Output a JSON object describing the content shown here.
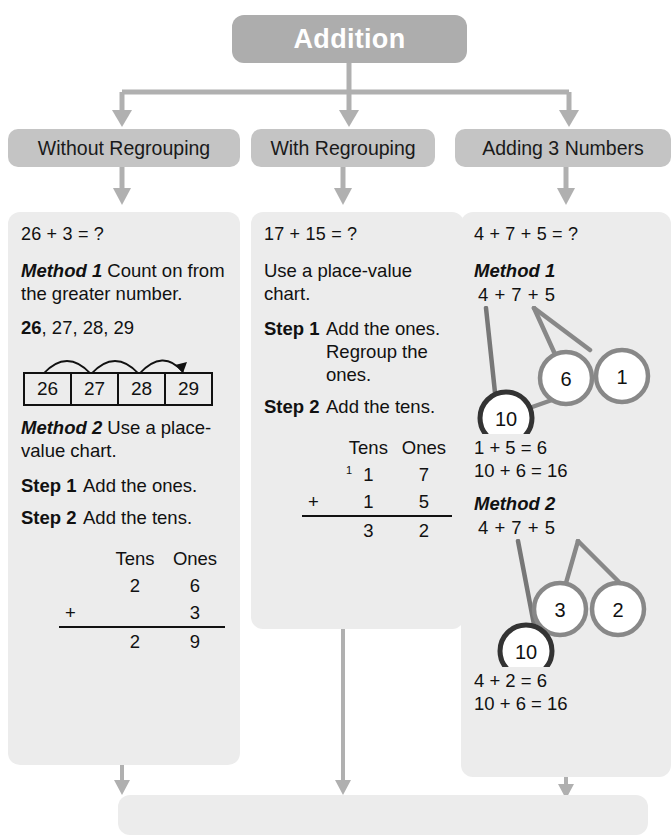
{
  "title": {
    "label": "Addition"
  },
  "colors": {
    "title_box": "#adadad",
    "category_box": "#c4c4c4",
    "panel": "#ececec",
    "connector": "#b0b0b0",
    "bond_circle": "#888888",
    "bond_total_circle": "#333333",
    "text": "#111111"
  },
  "categories": [
    {
      "label": "Without Regrouping"
    },
    {
      "label": "With Regrouping"
    },
    {
      "label": "Adding 3 Numbers"
    }
  ],
  "columns": [
    {
      "equation": "26 + 3 = ?",
      "method1_label": "Method 1",
      "method1_text": "Count on from the greater number.",
      "count_sequence_first": "26",
      "count_sequence_rest": ", 27, 28, 29",
      "numberline": [
        "26",
        "27",
        "28",
        "29"
      ],
      "method2_label": "Method 2",
      "method2_text": "Use a place-value chart.",
      "step1_label": "Step 1",
      "step1_text": "Add the ones.",
      "step2_label": "Step 2",
      "step2_text": "Add the tens.",
      "chart": {
        "head_tens": "Tens",
        "head_ones": "Ones",
        "row1_tens": "2",
        "row1_ones": "6",
        "sign": "+",
        "row2_tens": "",
        "row2_ones": "3",
        "sum_tens": "2",
        "sum_ones": "9",
        "carry": ""
      }
    },
    {
      "equation": "17 + 15 = ?",
      "intro": "Use a place-value chart.",
      "step1_label": "Step 1",
      "step1_text": "Add the ones. Regroup the ones.",
      "step2_label": "Step 2",
      "step2_text": "Add the tens.",
      "chart": {
        "head_tens": "Tens",
        "head_ones": "Ones",
        "row1_tens": "1",
        "row1_ones": "7",
        "sign": "+",
        "row2_tens": "1",
        "row2_ones": "5",
        "sum_tens": "3",
        "sum_ones": "2",
        "carry": "1"
      }
    },
    {
      "equation": "4 + 7 + 5 = ?",
      "method1_label": "Method 1",
      "method1_expression": "4  +   7 + 5",
      "method1_bond_parent": "7",
      "method1_bond_left": "6",
      "method1_bond_right": "1",
      "method1_total": "10",
      "method1_result1": "1 + 5 = 6",
      "method1_result2": "10 + 6 = 16",
      "method2_label": "Method 2",
      "method2_expression": "4 +  7   +  5",
      "method2_bond_parent": "5",
      "method2_bond_left": "3",
      "method2_bond_right": "2",
      "method2_total": "10",
      "method2_result1": "4 + 2 = 6",
      "method2_result2": "10 + 6 = 16"
    }
  ]
}
